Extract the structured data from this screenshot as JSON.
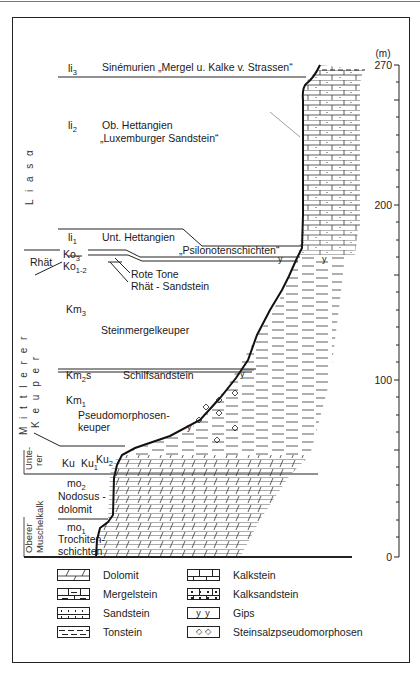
{
  "scale": {
    "unit": "(m)",
    "ticks": [
      {
        "value": "270",
        "y": 65
      },
      {
        "value": "200",
        "y": 205
      },
      {
        "value": "100",
        "y": 380
      },
      {
        "value": "0",
        "y": 557
      }
    ]
  },
  "groups": [
    {
      "id": "lias",
      "label": "L i a s α"
    },
    {
      "id": "mittlerer_keuper_1",
      "label": "M i t t l e r e r"
    },
    {
      "id": "mittlerer_keuper_2",
      "label": "K e u p e r"
    },
    {
      "id": "unterer_1",
      "label": "Unte-"
    },
    {
      "id": "unterer_2",
      "label": "rer"
    },
    {
      "id": "oberer_muschelkalk_1",
      "label": "Oberer"
    },
    {
      "id": "oberer_muschelkalk_2",
      "label": "Muschelkalk"
    }
  ],
  "units": [
    {
      "code": "li",
      "sub": "3",
      "name": "Sinémurien „Mergel u. Kalke v. Strassen“"
    },
    {
      "code": "li",
      "sub": "2",
      "name": "Ob. Hettangien",
      "name2": "„Luxemburger Sandstein“"
    },
    {
      "code": "li",
      "sub": "1",
      "name": "Unt. Hettangien"
    },
    {
      "code": "Ko",
      "sub": "3",
      "name": "„Psilonotenschichten“"
    },
    {
      "code": "Ko",
      "sub": "1-2",
      "name": "Rote Tone",
      "name2": "Rhät - Sandstein"
    },
    {
      "code": "Rhät"
    },
    {
      "code": "Km",
      "sub": "3",
      "name": "Steinmergelkeuper"
    },
    {
      "code": "Km",
      "sub": "2",
      "suffix": "s",
      "name": "Schilfsandstein"
    },
    {
      "code": "Km",
      "sub": "1",
      "name": "Pseudomorphosen-",
      "name2": "keuper"
    },
    {
      "code": "Ku",
      "name": "Ku",
      "sub1": "1",
      "code2": "Ku",
      "sub2": "2"
    },
    {
      "code": "mo",
      "sub": "2",
      "name": "Nodosus -",
      "name2": "dolomit"
    },
    {
      "code": "mo",
      "sub": "1",
      "name": "Trochiten-",
      "name2": "schichten"
    }
  ],
  "legend": [
    {
      "label": "Dolomit",
      "pattern": "dolomit"
    },
    {
      "label": "Kalkstein",
      "pattern": "kalkstein"
    },
    {
      "label": "Mergelstein",
      "pattern": "mergelstein"
    },
    {
      "label": "Kalksandstein",
      "pattern": "kalksandstein"
    },
    {
      "label": "Sandstein",
      "pattern": "sandstein"
    },
    {
      "label": "Gips",
      "pattern": "gips",
      "glyph": "y  y"
    },
    {
      "label": "Tonstein",
      "pattern": "tonstein"
    },
    {
      "label": "Steinsalzpseudomorphosen",
      "pattern": "pseudo",
      "glyph": "◇  ◇"
    }
  ]
}
